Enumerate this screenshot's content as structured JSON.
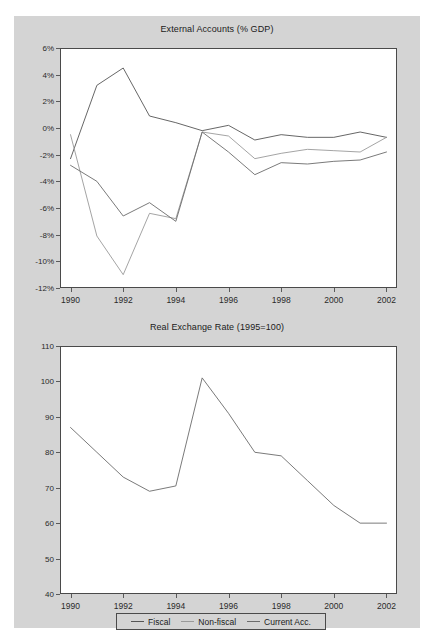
{
  "chart_data": [
    {
      "type": "line",
      "title": "External Accounts (% GDP)",
      "xlabel": "",
      "ylabel": "",
      "x": [
        1990,
        1991,
        1992,
        1993,
        1994,
        1995,
        1996,
        1997,
        1998,
        1999,
        2000,
        2001,
        2002
      ],
      "xlim": [
        1989.6,
        2002.4
      ],
      "ylim": [
        -12,
        6
      ],
      "yticks": [
        6,
        4,
        2,
        0,
        -2,
        -4,
        -6,
        -8,
        -10,
        -12
      ],
      "ytick_labels": [
        "6%",
        "4%",
        "2%",
        "0%",
        "-2%",
        "-4%",
        "-6%",
        "-8%",
        "-10%",
        "-12%"
      ],
      "xticks": [
        1990,
        1992,
        1994,
        1996,
        1998,
        2000,
        2002
      ],
      "xtick_labels": [
        "1990",
        "1992",
        "1994",
        "1996",
        "1998",
        "2000",
        "2002"
      ],
      "grid": false,
      "legend_position": "bottom",
      "series": [
        {
          "name": "Fiscal",
          "color": "#555555",
          "values": [
            -2.3,
            3.2,
            4.5,
            0.9,
            0.4,
            -0.2,
            0.2,
            -0.9,
            -0.5,
            -0.7,
            -0.7,
            -0.3,
            -0.7
          ]
        },
        {
          "name": "Non-fiscal",
          "color": "#9a9a9a",
          "values": [
            -0.5,
            -8.1,
            -11.0,
            -6.4,
            -6.8,
            -0.3,
            -0.6,
            -2.3,
            -1.9,
            -1.6,
            -1.7,
            -1.8,
            -0.7
          ]
        },
        {
          "name": "Current Acc.",
          "color": "#6b6b6b",
          "values": [
            -2.8,
            -4.0,
            -6.6,
            -5.6,
            -7.0,
            -0.3,
            -1.8,
            -3.5,
            -2.6,
            -2.7,
            -2.5,
            -2.4,
            -1.8
          ]
        }
      ]
    },
    {
      "type": "line",
      "title": "Real Exchange Rate (1995=100)",
      "xlabel": "",
      "ylabel": "",
      "x": [
        1990,
        1991,
        1992,
        1993,
        1994,
        1995,
        1996,
        1997,
        1998,
        1999,
        2000,
        2001,
        2002
      ],
      "xlim": [
        1989.6,
        2002.4
      ],
      "ylim": [
        40,
        110
      ],
      "yticks": [
        110,
        100,
        90,
        80,
        70,
        60,
        50,
        40
      ],
      "ytick_labels": [
        "110",
        "100",
        "90",
        "80",
        "70",
        "60",
        "50",
        "40"
      ],
      "xticks": [
        1990,
        1992,
        1994,
        1996,
        1998,
        2000,
        2002
      ],
      "xtick_labels": [
        "1990",
        "1992",
        "1994",
        "1996",
        "1998",
        "2000",
        "2002"
      ],
      "grid": false,
      "legend_position": "none",
      "series": [
        {
          "name": "Real Exchange Rate",
          "color": "#6b6b6b",
          "values": [
            87,
            80,
            73,
            69,
            70.5,
            101,
            91,
            80,
            79,
            72,
            65,
            60,
            60
          ]
        }
      ]
    }
  ],
  "legend": {
    "items": [
      {
        "label": "Fiscal"
      },
      {
        "label": "Non-fiscal"
      },
      {
        "label": "Current Acc."
      }
    ]
  }
}
